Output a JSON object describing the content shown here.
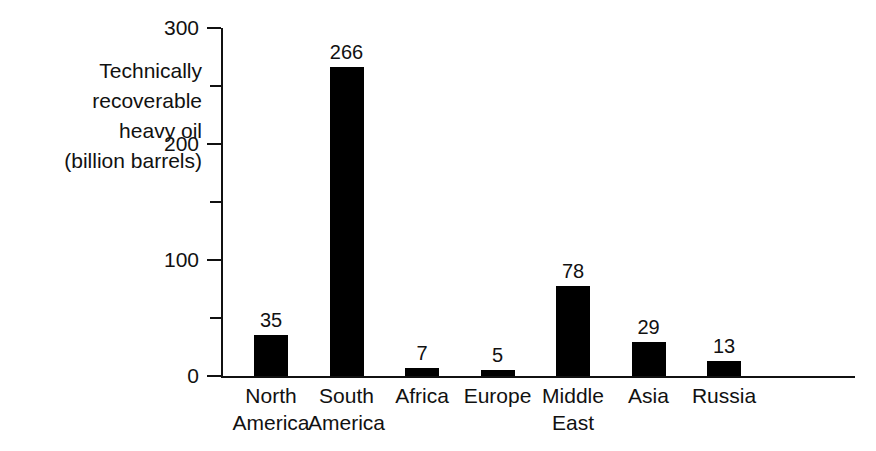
{
  "chart_data": {
    "type": "bar",
    "title": "",
    "xlabel": "",
    "ylabel": "Technically recoverable heavy oil (billion barrels)",
    "ylabel_lines": [
      "Technically",
      "recoverable",
      "heavy oil",
      "(billion barrels)"
    ],
    "categories": [
      "North America",
      "South America",
      "Africa",
      "Europe",
      "Middle East",
      "Asia",
      "Russia"
    ],
    "category_lines": [
      [
        "North",
        "America"
      ],
      [
        "South",
        "America"
      ],
      [
        "Africa"
      ],
      [
        "Europe"
      ],
      [
        "Middle",
        "East"
      ],
      [
        "Asia"
      ],
      [
        "Russia"
      ]
    ],
    "values": [
      35,
      266,
      7,
      5,
      78,
      29,
      13
    ],
    "value_labels": [
      "35",
      "266",
      "7",
      "5",
      "78",
      "29",
      "13"
    ],
    "ylim": [
      0,
      300
    ],
    "y_major_ticks": [
      0,
      100,
      200,
      300
    ],
    "y_major_tick_labels": [
      "0",
      "100",
      "200",
      "300"
    ],
    "y_minor_ticks": [
      50,
      150,
      250
    ],
    "grid": false,
    "legend": false,
    "bar_color": "#000000",
    "axis_color": "#111111"
  }
}
